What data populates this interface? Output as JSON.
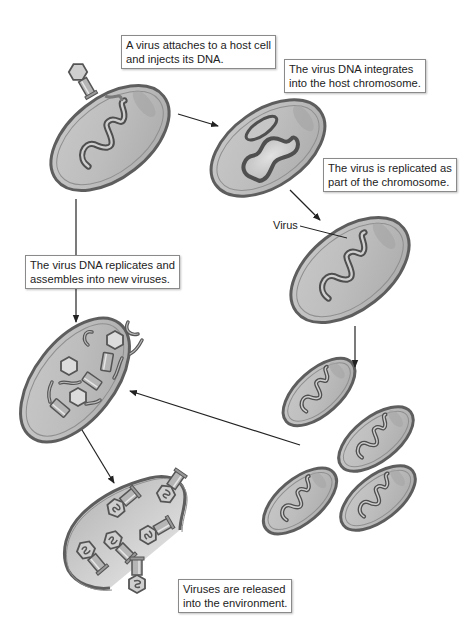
{
  "diagram": {
    "colors": {
      "cell_fill": "#b9b9b9",
      "cell_stroke": "#5e5e5e",
      "cell_highlight": "#d8d8d8",
      "dna_stroke": "#555555",
      "dna_inner": "#c4c4c4",
      "arrow": "#222222",
      "label_border": "#8a8a8a"
    },
    "labels": {
      "step1": {
        "line1": "A virus attaches to a host cell",
        "line2": "and injects its DNA."
      },
      "step2": {
        "line1": "The virus DNA integrates",
        "line2": "into the host chromosome."
      },
      "step3": {
        "line1": "The virus is replicated as",
        "line2": "part of the chromosome."
      },
      "step4": {
        "line1": "The virus DNA replicates and",
        "line2": "assembles into new viruses."
      },
      "step5": {
        "line1": "Viruses are released",
        "line2": "into the environment."
      },
      "virus_pointer": "Virus"
    },
    "nodes": [
      {
        "id": "cell-infection",
        "description": "bacterium with phage attached injecting DNA"
      },
      {
        "id": "cell-integration",
        "description": "bacterium with circular viral DNA integrating"
      },
      {
        "id": "cell-prophage",
        "description": "bacterium with prophage in chromosome"
      },
      {
        "id": "cells-division",
        "description": "four daughter cells carrying prophage"
      },
      {
        "id": "cell-assembly",
        "description": "bacterium filled with phage heads, tails and DNA"
      },
      {
        "id": "cell-lysis",
        "description": "burst cell releasing new phages"
      }
    ],
    "edges": [
      {
        "from": "cell-infection",
        "to": "cell-integration"
      },
      {
        "from": "cell-integration",
        "to": "cell-prophage"
      },
      {
        "from": "cell-prophage",
        "to": "cells-division"
      },
      {
        "from": "cells-division",
        "to": "cell-assembly"
      },
      {
        "from": "cell-infection",
        "to": "cell-assembly"
      },
      {
        "from": "cell-assembly",
        "to": "cell-lysis"
      }
    ]
  }
}
